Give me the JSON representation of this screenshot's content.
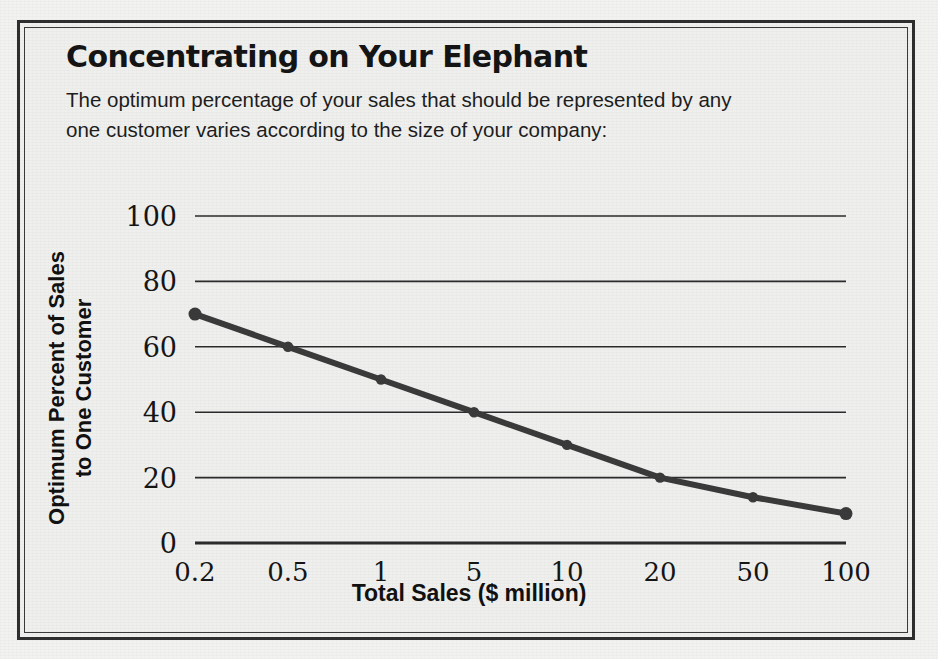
{
  "figure": {
    "title": "Concentrating on Your Elephant",
    "subtitle": "The optimum percentage of your sales that should be represented by any one customer varies according to the size of your company:"
  },
  "colors": {
    "page_background": "#f2f2f1",
    "panel_background": "#efefee",
    "frame": "#2e2e2e",
    "series_line": "#3a3a3a",
    "gridline": "#2b2b2b",
    "text": "#141414"
  },
  "chart_data": {
    "type": "line",
    "title": "Concentrating on Your Elephant",
    "subtitle": "The optimum percentage of your sales that should be represented by any one customer varies according to the size of your company:",
    "xlabel": "Total Sales ($ million)",
    "ylabel": "Optimum Percent of Sales to One Customer",
    "ylabel_lines": [
      "Optimum Percent of Sales",
      "to One Customer"
    ],
    "categories": [
      "0.2",
      "0.5",
      "1",
      "5",
      "10",
      "20",
      "50",
      "100"
    ],
    "values": [
      70,
      60,
      50,
      40,
      30,
      20,
      14,
      9
    ],
    "ylim": [
      0,
      100
    ],
    "yticks": [
      0,
      20,
      40,
      60,
      80,
      100
    ],
    "ytick_labels": [
      "0",
      "20",
      "40",
      "60",
      "80",
      "100"
    ],
    "grid": true,
    "grid_axis": "y",
    "legend": false,
    "markers": true,
    "x_scale": "categorical (log-spaced labels, evenly spaced positions)"
  }
}
